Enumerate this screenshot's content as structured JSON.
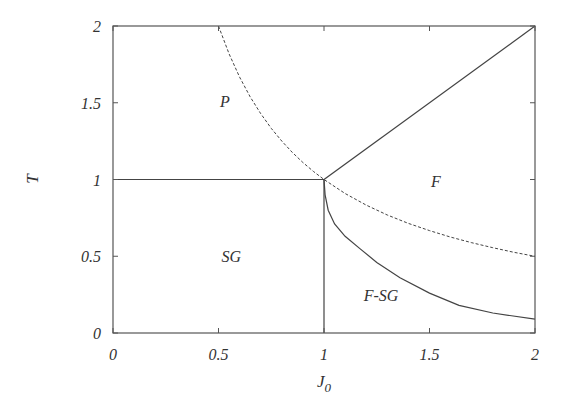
{
  "chart_data": {
    "type": "line",
    "title": "",
    "xlabel": "J",
    "xlabel_sub": "0",
    "ylabel": "T",
    "xlim": [
      0,
      2
    ],
    "ylim": [
      0,
      2
    ],
    "grid": false,
    "x_ticks": [
      0,
      0.5,
      1,
      1.5,
      2
    ],
    "x_tick_labels": [
      "0",
      "0.5",
      "1",
      "1.5",
      "2"
    ],
    "y_ticks": [
      0,
      0.5,
      1,
      1.5,
      2
    ],
    "y_tick_labels": [
      "0",
      "0.5",
      "1",
      "1.5",
      "2"
    ],
    "series": [
      {
        "name": "P-SG boundary",
        "style": "solid",
        "x": [
          0,
          1
        ],
        "y": [
          1,
          1
        ]
      },
      {
        "name": "SG-F-SG boundary",
        "style": "solid",
        "x": [
          1,
          1
        ],
        "y": [
          0,
          1
        ]
      },
      {
        "name": "P-F boundary",
        "style": "solid",
        "x": [
          1,
          2
        ],
        "y": [
          1,
          2
        ]
      },
      {
        "name": "dashed T=1/J0",
        "style": "dashed",
        "x": [
          0.5,
          0.55,
          0.6,
          0.65,
          0.7,
          0.75,
          0.8,
          0.85,
          0.9,
          0.95,
          1.0,
          1.1,
          1.2,
          1.3,
          1.4,
          1.5,
          1.6,
          1.7,
          1.8,
          1.9,
          2.0
        ],
        "y": [
          2.0,
          1.818,
          1.667,
          1.538,
          1.429,
          1.333,
          1.25,
          1.176,
          1.111,
          1.053,
          1.0,
          0.909,
          0.833,
          0.769,
          0.714,
          0.667,
          0.625,
          0.588,
          0.556,
          0.526,
          0.5
        ]
      },
      {
        "name": "F/F-SG boundary",
        "style": "solid",
        "x": [
          1.0,
          1.005,
          1.02,
          1.05,
          1.1,
          1.17,
          1.25,
          1.36,
          1.5,
          1.64,
          1.8,
          2.0
        ],
        "y": [
          1.0,
          0.9,
          0.8,
          0.71,
          0.63,
          0.55,
          0.46,
          0.36,
          0.26,
          0.18,
          0.13,
          0.09
        ]
      }
    ],
    "annotations": [
      {
        "text": "P",
        "x": 0.53,
        "y": 1.51
      },
      {
        "text": "F",
        "x": 1.53,
        "y": 0.99
      },
      {
        "text": "SG",
        "x": 0.56,
        "y": 0.5
      },
      {
        "text": "F-SG",
        "x": 1.27,
        "y": 0.25
      }
    ]
  },
  "plot_area": {
    "left": 113,
    "top": 26,
    "right": 535,
    "bottom": 333
  },
  "colors": {
    "axis": "#555555",
    "line": "#444444",
    "text": "#333333"
  }
}
